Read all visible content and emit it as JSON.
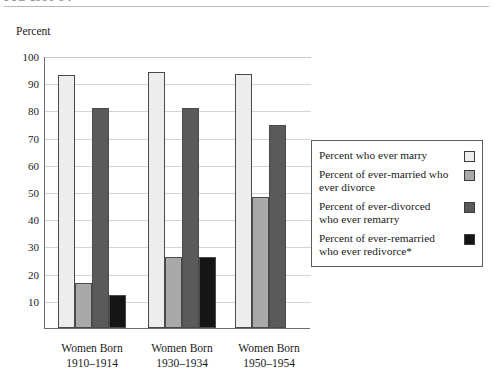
{
  "header": {
    "title_fragment": "FIG 1990-94",
    "rule": "horizontal-rule"
  },
  "axis": {
    "ylabel": "Percent",
    "yticks": [
      100,
      90,
      80,
      70,
      60,
      50,
      40,
      30,
      20,
      10
    ],
    "ymin": 0,
    "ymax": 100
  },
  "legend": {
    "entries": [
      {
        "label": "Percent who ever marry",
        "color": "#ededed"
      },
      {
        "label": "Percent of ever-married who ever divorce",
        "color": "#a9a9a9"
      },
      {
        "label": "Percent of ever-divorced who ever remarry",
        "color": "#5a5a5a"
      },
      {
        "label": "Percent of ever-remarried who ever redivorce*",
        "color": "#151515"
      }
    ]
  },
  "chart_data": {
    "type": "bar",
    "title": "",
    "xlabel": "",
    "ylabel": "Percent",
    "ylim": [
      0,
      100
    ],
    "grid": true,
    "legend_position": "right",
    "categories": [
      "Women Born 1910–1914",
      "Women Born 1930–1934",
      "Women Born 1950–1954"
    ],
    "category_lines": [
      [
        "Women Born",
        "1910–1914"
      ],
      [
        "Women Born",
        "1930–1934"
      ],
      [
        "Women Born",
        "1950–1954"
      ]
    ],
    "series": [
      {
        "name": "Percent who ever marry",
        "color": "#ededed",
        "values": [
          93,
          94,
          93.5
        ]
      },
      {
        "name": "Percent of ever-married who ever divorce",
        "color": "#a9a9a9",
        "values": [
          16.5,
          26,
          48
        ]
      },
      {
        "name": "Percent of ever-divorced who ever remarry",
        "color": "#5a5a5a",
        "values": [
          81,
          81,
          74.5
        ]
      },
      {
        "name": "Percent of ever-remarried who ever redivorce*",
        "color": "#151515",
        "values": [
          12,
          26,
          null
        ]
      }
    ]
  }
}
